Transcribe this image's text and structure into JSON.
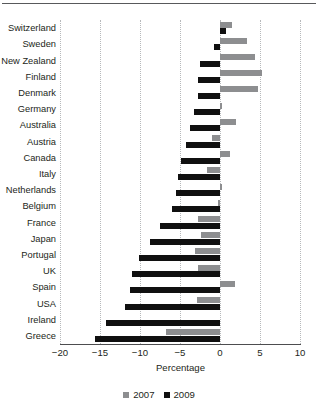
{
  "chart_data": {
    "type": "bar",
    "orientation": "horizontal",
    "title": "",
    "xlabel": "Percentage",
    "ylabel": "",
    "xlim": [
      -20,
      10
    ],
    "xticks": [
      -20,
      -15,
      -10,
      -5,
      0,
      5,
      10
    ],
    "xticklabels": [
      "−20",
      "−15",
      "−10",
      "−5",
      "0",
      "5",
      "10"
    ],
    "grid": "vertical-dotted",
    "legend_position": "bottom-center",
    "categories": [
      "Switzerland",
      "Sweden",
      "New Zealand",
      "Finland",
      "Denmark",
      "Germany",
      "Australia",
      "Austria",
      "Canada",
      "Italy",
      "Netherlands",
      "Belgium",
      "France",
      "Japan",
      "Portugal",
      "UK",
      "Spain",
      "USA",
      "Ireland",
      "Greece"
    ],
    "series": [
      {
        "name": "2007",
        "color": "#8d8e90",
        "values": [
          1.5,
          3.4,
          4.4,
          5.3,
          4.8,
          0.2,
          2.0,
          -1.0,
          1.3,
          -1.6,
          0.2,
          -0.3,
          -2.7,
          -2.4,
          -3.1,
          -2.8,
          1.9,
          -2.9,
          0.0,
          -6.8
        ]
      },
      {
        "name": "2009",
        "color": "#101010",
        "values": [
          0.7,
          -0.8,
          -2.5,
          -2.7,
          -2.8,
          -3.2,
          -3.8,
          -4.2,
          -4.9,
          -5.3,
          -5.5,
          -6.0,
          -7.5,
          -8.7,
          -10.1,
          -11.0,
          -11.2,
          -11.9,
          -14.2,
          -15.6
        ]
      }
    ]
  },
  "legend": {
    "items": [
      {
        "label": "2007",
        "color": "#8d8e90"
      },
      {
        "label": "2009",
        "color": "#101010"
      }
    ]
  },
  "axis": {
    "title": "Percentage"
  }
}
